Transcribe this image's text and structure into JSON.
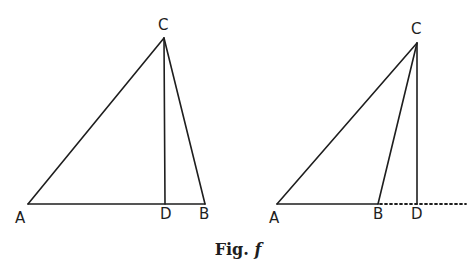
{
  "figure": {
    "caption_prefix": "Fig.",
    "caption_letter": "f",
    "stroke_color": "#1e1e1e",
    "background": "#ffffff"
  },
  "left_triangle": {
    "labels": {
      "A": "A",
      "B": "B",
      "C": "C",
      "D": "D"
    },
    "points": {
      "A": [
        28,
        204
      ],
      "C": [
        164,
        38
      ],
      "D": [
        165,
        204
      ],
      "B": [
        205,
        204
      ]
    },
    "description": "Acute triangle ABC with altitude CD falling inside base AB"
  },
  "right_triangle": {
    "labels": {
      "A": "A",
      "B": "B",
      "C": "C",
      "D": "D"
    },
    "points": {
      "A": [
        277,
        204
      ],
      "C": [
        417,
        43
      ],
      "B": [
        378,
        204
      ],
      "D": [
        417,
        204
      ],
      "dotted_end": [
        466,
        204
      ]
    },
    "description": "Obtuse triangle ABC with altitude CD falling outside on extended base (dotted)"
  }
}
